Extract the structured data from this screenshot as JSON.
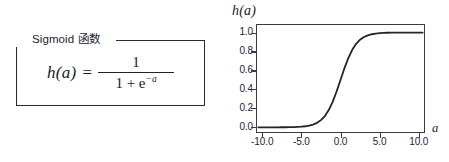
{
  "figure": {
    "background_color": "#ffffff",
    "ink_color": "#24242f"
  },
  "formula_panel": {
    "legend_label": "Sigmoid 函数",
    "equation": {
      "lhs": "h(a)",
      "relation": "=",
      "numerator": "1",
      "denominator_prefix": "1 + e",
      "denominator_exponent": "−a",
      "plain_text": "h(a) = 1 / (1 + e^(-a))"
    }
  },
  "plot_panel": {
    "title": "h(a)",
    "xaxis_label": "a"
  },
  "chart_data": {
    "type": "line",
    "title": "h(a)",
    "xlabel": "a",
    "ylabel": "h(a)",
    "xlim": [
      -10.8,
      10.8
    ],
    "ylim": [
      -0.06,
      1.09
    ],
    "grid": false,
    "legend": "none",
    "xticks": [
      "-10.0",
      "-5.0",
      "0.0",
      "5.0",
      "10.0"
    ],
    "xtick_values": [
      -10,
      -5,
      0,
      5,
      10
    ],
    "yticks": [
      "0.0",
      "0.2",
      "0.4",
      "0.6",
      "0.8",
      "1.0"
    ],
    "ytick_values": [
      0.0,
      0.2,
      0.4,
      0.6,
      0.8,
      1.0
    ],
    "series": [
      {
        "name": "sigmoid",
        "function": "1/(1+exp(-x))",
        "color": "#23232e",
        "line_width": 1.8,
        "x": [
          -10.5,
          -10,
          -9.5,
          -9,
          -8.5,
          -8,
          -7.5,
          -7,
          -6.5,
          -6,
          -5.5,
          -5,
          -4.5,
          -4,
          -3.5,
          -3,
          -2.5,
          -2,
          -1.5,
          -1,
          -0.5,
          0,
          0.5,
          1,
          1.5,
          2,
          2.5,
          3,
          3.5,
          4,
          4.5,
          5,
          5.5,
          6,
          6.5,
          7,
          7.5,
          8,
          8.5,
          9,
          9.5,
          10,
          10.5
        ],
        "y": [
          0.0,
          0.0,
          0.0001,
          0.0001,
          0.0002,
          0.0003,
          0.0006,
          0.0009,
          0.0015,
          0.0025,
          0.0041,
          0.0067,
          0.011,
          0.018,
          0.0293,
          0.0474,
          0.0759,
          0.1192,
          0.1824,
          0.2689,
          0.3775,
          0.5,
          0.6225,
          0.7311,
          0.8176,
          0.8808,
          0.9241,
          0.9526,
          0.9707,
          0.982,
          0.989,
          0.9933,
          0.9959,
          0.9975,
          0.9985,
          0.9991,
          0.9994,
          0.9997,
          0.9998,
          0.9999,
          0.9999,
          1.0,
          1.0
        ]
      }
    ]
  }
}
